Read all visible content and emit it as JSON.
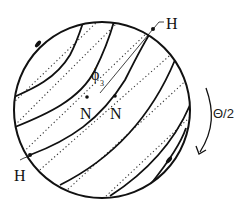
{
  "diagram": {
    "labels": {
      "h_top": "H",
      "h_bottom": "H",
      "phi": "ϕ",
      "phi_sub": "3",
      "n_tilde": "Ñ",
      "n_plain": "N",
      "n_tilde_left": "N",
      "rotation": "Θ/2"
    },
    "colors": {
      "stroke": "#111111",
      "background": "#ffffff"
    }
  }
}
